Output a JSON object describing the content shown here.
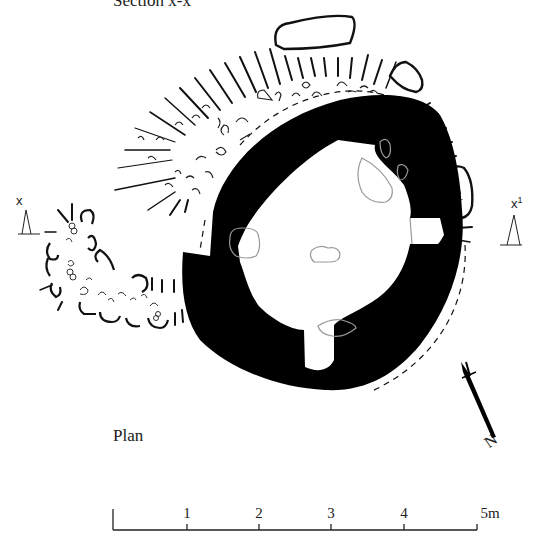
{
  "figure": {
    "title": "Section x-x",
    "view_label": "Plan",
    "type": "archaeological site plan"
  },
  "section_markers": [
    {
      "id": "x",
      "label": "x",
      "position": "left"
    },
    {
      "id": "x1",
      "label": "x",
      "superscript": "1",
      "position": "right"
    }
  ],
  "north_arrow": {
    "label": "N"
  },
  "scale_bar": {
    "unit": "m",
    "ticks": [
      "",
      "1",
      "2",
      "3",
      "4",
      "5m"
    ],
    "max": 5
  },
  "legend_colors": {
    "wall": "#000000",
    "stones": "#111111",
    "floor_stones": "#9a9a9a",
    "background": "#ffffff"
  }
}
